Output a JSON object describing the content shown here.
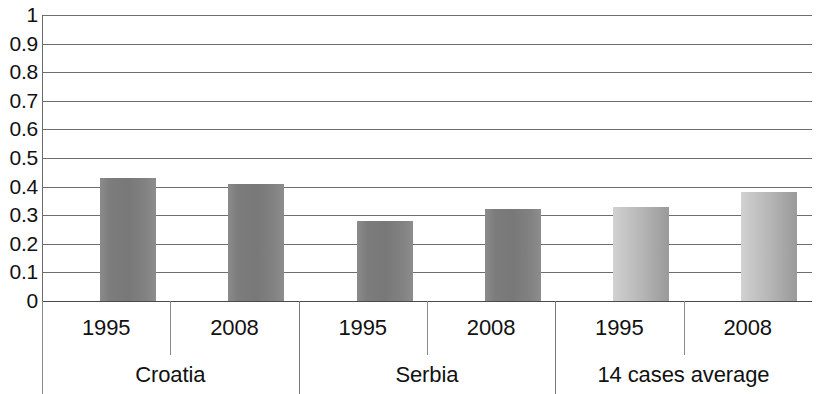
{
  "chart_data": {
    "type": "bar",
    "title": "",
    "subtitle": "",
    "xlabel": "",
    "ylabel": "",
    "ylim": [
      0,
      1
    ],
    "grid": true,
    "legend": "none",
    "y_ticks": [
      "1",
      "0.9",
      "0.8",
      "0.7",
      "0.6",
      "0.5",
      "0.4",
      "0.3",
      "0.2",
      "0.1",
      "0"
    ],
    "y_tick_values": [
      1,
      0.9,
      0.8,
      0.7,
      0.6,
      0.5,
      0.4,
      0.3,
      0.2,
      0.1,
      0
    ],
    "groups": [
      "Croatia",
      "Serbia",
      "14 cases average"
    ],
    "categories": [
      "1995",
      "2008",
      "1995",
      "2008",
      "1995",
      "2008"
    ],
    "values": [
      0.43,
      0.41,
      0.28,
      0.32,
      0.33,
      0.38
    ],
    "bars": [
      {
        "group": "Croatia",
        "year": "1995",
        "value": 0.43,
        "style": "dark"
      },
      {
        "group": "Croatia",
        "year": "2008",
        "value": 0.41,
        "style": "dark"
      },
      {
        "group": "Serbia",
        "year": "1995",
        "value": 0.28,
        "style": "dark"
      },
      {
        "group": "Serbia",
        "year": "2008",
        "value": 0.32,
        "style": "dark"
      },
      {
        "group": "14 cases average",
        "year": "1995",
        "value": 0.33,
        "style": "light"
      },
      {
        "group": "14 cases average",
        "year": "2008",
        "value": 0.38,
        "style": "light"
      }
    ],
    "colors": {
      "bar_dark": "#7c7c7c",
      "bar_light": "#bdbdbd",
      "gridline": "#6e6e6e",
      "axis": "#6b6b6b",
      "text": "#111111",
      "background": "#ffffff"
    }
  }
}
